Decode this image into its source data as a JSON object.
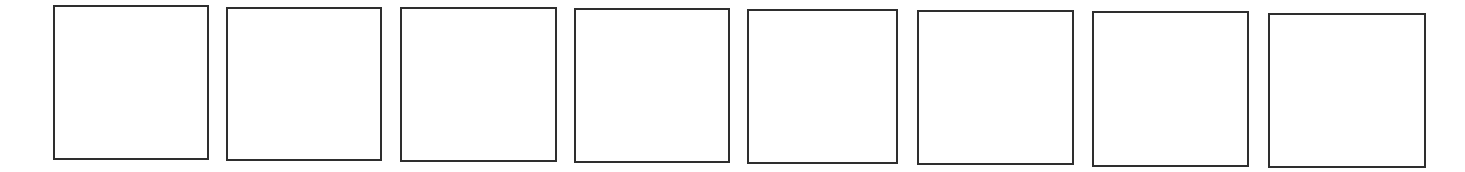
{
  "diagram": {
    "stroke_color": "#2e2e2e",
    "background_color": "#ffffff",
    "boxes": [
      {
        "index": 1,
        "x": 53,
        "y": 5,
        "w": 156,
        "h": 155,
        "label": ""
      },
      {
        "index": 2,
        "x": 226,
        "y": 7,
        "w": 156,
        "h": 154,
        "label": ""
      },
      {
        "index": 3,
        "x": 400,
        "y": 7,
        "w": 157,
        "h": 155,
        "label": ""
      },
      {
        "index": 4,
        "x": 574,
        "y": 8,
        "w": 156,
        "h": 155,
        "label": ""
      },
      {
        "index": 5,
        "x": 747,
        "y": 9,
        "w": 151,
        "h": 155,
        "label": ""
      },
      {
        "index": 6,
        "x": 917,
        "y": 10,
        "w": 157,
        "h": 155,
        "label": ""
      },
      {
        "index": 7,
        "x": 1092,
        "y": 11,
        "w": 157,
        "h": 156,
        "label": ""
      },
      {
        "index": 8,
        "x": 1268,
        "y": 13,
        "w": 158,
        "h": 155,
        "label": ""
      }
    ]
  }
}
